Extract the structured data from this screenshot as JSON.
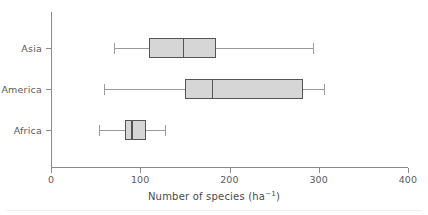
{
  "chart_data": {
    "type": "box",
    "title": "",
    "xlabel": "Number of species (ha⁻¹)",
    "ylabel": "",
    "xlim": [
      0,
      400
    ],
    "xticks": [
      0,
      100,
      200,
      300,
      400
    ],
    "xtick_labels": [
      "0",
      "100",
      "200",
      "300",
      "400"
    ],
    "grid": false,
    "legend": "none",
    "orientation": "horizontal",
    "categories": [
      "Asia",
      "America",
      "Africa"
    ],
    "boxes": [
      {
        "label": "Asia",
        "min": 71,
        "q1": 110,
        "median": 148,
        "q3": 185,
        "max": 294
      },
      {
        "label": "America",
        "min": 59,
        "q1": 150,
        "median": 180,
        "q3": 282,
        "max": 306
      },
      {
        "label": "Africa",
        "min": 54,
        "q1": 83,
        "median": 90,
        "q3": 106,
        "max": 128
      }
    ],
    "colors": {
      "box_fill": "#d6d6d6",
      "box_edge": "#555555",
      "whisker": "#9a9a9a",
      "axis": "#8a8a8a",
      "text": "#4a4a4a",
      "background": "#ffffff"
    }
  },
  "axis": {
    "x_label_main": "Number of species (ha",
    "x_label_sup": "−1",
    "x_label_close": ")"
  }
}
